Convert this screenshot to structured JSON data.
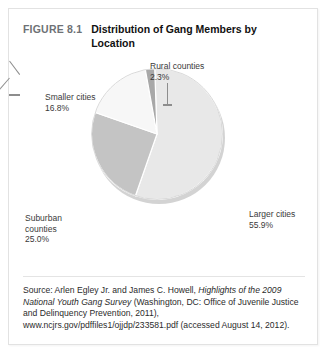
{
  "figure": {
    "number": "FIGURE 8.1",
    "title": "Distribution of Gang Members by Location"
  },
  "source": {
    "prefix": "Source: Arlen Egley Jr. and James C. Howell, ",
    "italic_title": "Highlights of the 2009 National Youth Gang Survey",
    "suffix": " (Washington, DC: Office of Juvenile Justice and Delinquency Prevention, 2011), www.ncjrs.gov/pdffiles1/ojjdp/233581.pdf (accessed August 14, 2012)."
  },
  "labels": {
    "rural": "Rural counties",
    "rural_pct": "2.3%",
    "smaller": "Smaller cities",
    "smaller_pct": "16.8%",
    "suburban_line1": "Suburban",
    "suburban_line2": "counties",
    "suburban_pct": "25.0%",
    "larger": "Larger cities",
    "larger_pct": "55.9%"
  },
  "colors": {
    "larger_cities": "#e8e8e8",
    "suburban_counties": "#c4c4c4",
    "smaller_cities": "#f7f7f7",
    "rural_counties": "#a8a8a8",
    "slice_outline": "#bdbdbd",
    "card_border": "#e2e2e2",
    "leader_line": "#8d8d8d",
    "figure_number": "#6e7175"
  },
  "chart_data": {
    "type": "pie",
    "title": "Distribution of Gang Members by Location",
    "categories": [
      "Larger cities",
      "Suburban counties",
      "Smaller cities",
      "Rural counties"
    ],
    "values": [
      55.9,
      25.0,
      16.8,
      2.3
    ],
    "unit": "percent",
    "total": 100.0,
    "labels_shown": [
      "Larger cities 55.9%",
      "Suburban counties 25.0%",
      "Smaller cities 16.8%",
      "Rural counties 2.3%"
    ],
    "slice_colors": [
      "#e8e8e8",
      "#c4c4c4",
      "#f7f7f7",
      "#a8a8a8"
    ],
    "start_angle_deg": -2,
    "direction": "clockwise",
    "legend": "none",
    "labels_position": "outside-with-leader-lines",
    "grid": false
  }
}
